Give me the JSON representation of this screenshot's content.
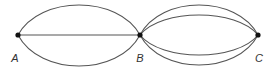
{
  "diagram": {
    "title": "",
    "colors": {
      "edge": "#555555",
      "node": "#111111",
      "label": "#333333"
    },
    "nodes": [
      {
        "id": "A",
        "label": "A",
        "x": 18,
        "y": 35,
        "label_x": 15,
        "label_y": 62
      },
      {
        "id": "B",
        "label": "B",
        "x": 140,
        "y": 35,
        "label_x": 140,
        "label_y": 62
      },
      {
        "id": "C",
        "label": "C",
        "x": 258,
        "y": 35,
        "label_x": 259,
        "label_y": 62
      }
    ],
    "edges": [
      {
        "from": "A",
        "to": "B",
        "shape": "arc",
        "peak_y": 5
      },
      {
        "from": "A",
        "to": "B",
        "shape": "line"
      },
      {
        "from": "A",
        "to": "B",
        "shape": "arc",
        "peak_y": 66
      },
      {
        "from": "B",
        "to": "C",
        "shape": "arc",
        "peak_y": 5
      },
      {
        "from": "B",
        "to": "C",
        "shape": "arc",
        "peak_y": 15
      },
      {
        "from": "B",
        "to": "C",
        "shape": "arc",
        "peak_y": 55
      },
      {
        "from": "B",
        "to": "C",
        "shape": "arc",
        "peak_y": 65
      }
    ],
    "edge_counts": {
      "A-B": 3,
      "B-C": 4
    }
  }
}
